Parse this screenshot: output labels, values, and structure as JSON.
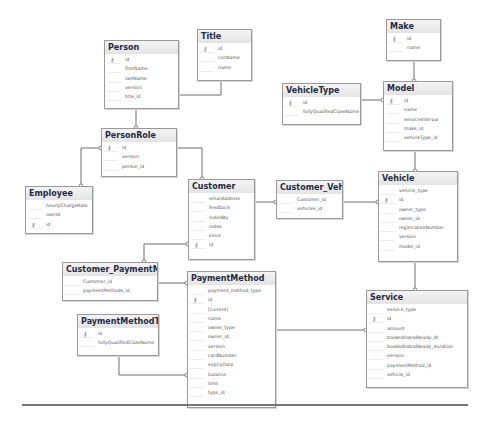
{
  "diagram": {
    "tables": [
      {
        "id": "person",
        "title": "Person",
        "x": 104,
        "y": 40,
        "w": 73,
        "h": 67,
        "columns": [
          {
            "name": "id",
            "key": true
          },
          {
            "name": "firstName"
          },
          {
            "name": "lastName"
          },
          {
            "name": "version"
          },
          {
            "name": "title_id"
          }
        ]
      },
      {
        "id": "title",
        "title": "Title",
        "x": 197,
        "y": 29,
        "w": 53,
        "h": 50,
        "columns": [
          {
            "name": "id",
            "key": true
          },
          {
            "name": "conName"
          },
          {
            "name": "name"
          }
        ]
      },
      {
        "id": "make",
        "title": "Make",
        "x": 386,
        "y": 19,
        "w": 53,
        "h": 40,
        "columns": [
          {
            "name": "id",
            "key": true
          },
          {
            "name": "name"
          }
        ]
      },
      {
        "id": "vehicletype",
        "title": "VehicleType",
        "x": 282,
        "y": 83,
        "w": 77,
        "h": 40,
        "columns": [
          {
            "name": "id",
            "key": true
          },
          {
            "name": "fullyQualifiedClassName"
          }
        ]
      },
      {
        "id": "model",
        "title": "Model",
        "x": 383,
        "y": 81,
        "w": 68,
        "h": 68,
        "columns": [
          {
            "name": "id",
            "key": true
          },
          {
            "name": "name"
          },
          {
            "name": "serviceInterval"
          },
          {
            "name": "make_id"
          },
          {
            "name": "vehicleType_id"
          }
        ]
      },
      {
        "id": "personrole",
        "title": "PersonRole",
        "x": 101,
        "y": 128,
        "w": 74,
        "h": 47,
        "columns": [
          {
            "name": "id",
            "key": true
          },
          {
            "name": "version"
          },
          {
            "name": "person_id"
          }
        ]
      },
      {
        "id": "employee",
        "title": "Employee",
        "x": 25,
        "y": 186,
        "w": 66,
        "h": 46,
        "columns": [
          {
            "name": "hourlyChargeRate"
          },
          {
            "name": "userId"
          },
          {
            "name": "id",
            "key": true
          }
        ]
      },
      {
        "id": "customer",
        "title": "Customer",
        "x": 188,
        "y": 179,
        "w": 65,
        "h": 79,
        "columns": [
          {
            "name": "emailAddress"
          },
          {
            "name": "feedback"
          },
          {
            "name": "notedBy"
          },
          {
            "name": "notes"
          },
          {
            "name": "since"
          },
          {
            "name": "id",
            "key": true
          }
        ]
      },
      {
        "id": "customer_vehicle",
        "title": "Customer_Vehicle",
        "x": 276,
        "y": 180,
        "w": 65,
        "h": 37,
        "columns": [
          {
            "name": "Customer_id"
          },
          {
            "name": "vehicles_id"
          }
        ]
      },
      {
        "id": "vehicle",
        "title": "Vehicle",
        "x": 378,
        "y": 171,
        "w": 78,
        "h": 89,
        "columns": [
          {
            "name": "vehicle_type"
          },
          {
            "name": "id",
            "key": true
          },
          {
            "name": "owner_type"
          },
          {
            "name": "owner_id"
          },
          {
            "name": "registrationNumber"
          },
          {
            "name": "version"
          },
          {
            "name": "model_id"
          }
        ]
      },
      {
        "id": "customer_paymentmethod",
        "title": "Customer_PaymentMethod",
        "x": 62,
        "y": 262,
        "w": 94,
        "h": 37,
        "columns": [
          {
            "name": "Customer_id"
          },
          {
            "name": "paymentMethods_id"
          }
        ]
      },
      {
        "id": "paymentmethod",
        "title": "PaymentMethod",
        "x": 187,
        "y": 271,
        "w": 87,
        "h": 135,
        "columns": [
          {
            "name": "payment_method_type"
          },
          {
            "name": "id",
            "key": true
          },
          {
            "name": "[current]"
          },
          {
            "name": "name"
          },
          {
            "name": "owner_type"
          },
          {
            "name": "owner_id"
          },
          {
            "name": "version"
          },
          {
            "name": "cardNumber"
          },
          {
            "name": "expiryDate"
          },
          {
            "name": "balance"
          },
          {
            "name": "limit"
          },
          {
            "name": "type_id"
          }
        ]
      },
      {
        "id": "paymentmethodtype",
        "title": "PaymentMethodType",
        "x": 77,
        "y": 314,
        "w": 80,
        "h": 40,
        "columns": [
          {
            "name": "id",
            "key": true
          },
          {
            "name": "fullyQualifiedClassName"
          }
        ]
      },
      {
        "id": "service",
        "title": "Service",
        "x": 366,
        "y": 290,
        "w": 100,
        "h": 96,
        "columns": [
          {
            "name": "service_type"
          },
          {
            "name": "id",
            "key": true
          },
          {
            "name": "amount"
          },
          {
            "name": "bookedInAndReady_dt"
          },
          {
            "name": "bookedInAndReady_duration"
          },
          {
            "name": "version"
          },
          {
            "name": "paymentMethod_id"
          },
          {
            "name": "vehicle_id"
          }
        ]
      }
    ],
    "relationships": [
      {
        "from": "person",
        "to": "title",
        "path": "M177,95 L221,95 L221,79"
      },
      {
        "from": "personrole",
        "to": "person",
        "path": "M136,107 L136,128"
      },
      {
        "from": "personrole",
        "to": "employee",
        "path": "M101,148 L81,148 L81,186"
      },
      {
        "from": "personrole",
        "to": "customer",
        "path": "M175,148 L202,148 L202,179"
      },
      {
        "from": "model",
        "to": "make",
        "path": "M414,59 L414,81"
      },
      {
        "from": "model",
        "to": "vehicletype",
        "path": "M359,100 L383,100"
      },
      {
        "from": "vehicle",
        "to": "model",
        "path": "M415,149 L415,171"
      },
      {
        "from": "customer_vehicle",
        "to": "customer",
        "path": "M253,202 L276,202"
      },
      {
        "from": "customer_vehicle",
        "to": "vehicle",
        "path": "M341,202 L378,202"
      },
      {
        "from": "customer_paymentmethod",
        "to": "customer",
        "path": "M144,262 L144,244 L188,244"
      },
      {
        "from": "customer_paymentmethod",
        "to": "paymentmethod",
        "path": "M156,283 L187,283"
      },
      {
        "from": "paymentmethod",
        "to": "paymentmethodtype",
        "path": "M187,375 L119,375 L119,354"
      },
      {
        "from": "service",
        "to": "paymentmethod",
        "path": "M274,330 L366,330"
      },
      {
        "from": "service",
        "to": "vehicle",
        "path": "M415,260 L415,290"
      }
    ]
  }
}
